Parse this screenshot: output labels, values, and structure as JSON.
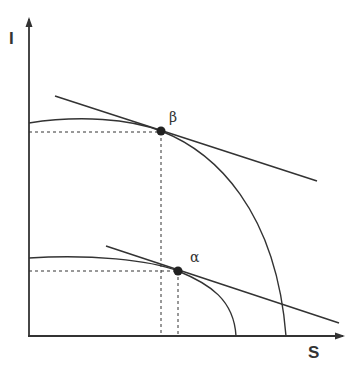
{
  "diagram": {
    "type": "production-possibility-frontier",
    "axes": {
      "y_label": "I",
      "x_label": "S"
    },
    "points": [
      {
        "id": "beta",
        "label": "β",
        "x": 161,
        "y": 131
      },
      {
        "id": "alpha",
        "label": "α",
        "x": 178,
        "y": 271
      }
    ],
    "curves": [
      {
        "id": "upper-frontier",
        "tangent_at": "beta"
      },
      {
        "id": "lower-frontier",
        "tangent_at": "alpha"
      }
    ],
    "colors": {
      "stroke": "#333333",
      "background": "#ffffff"
    }
  }
}
